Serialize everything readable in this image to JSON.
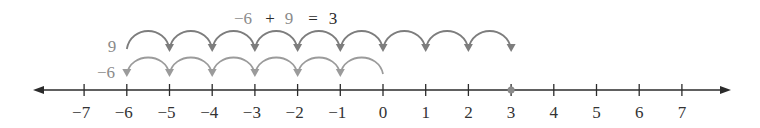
{
  "equation": {
    "term1": "−6",
    "plus": "+",
    "term2": "9",
    "equals": "=",
    "result": "3"
  },
  "rows": {
    "top": {
      "label": "9",
      "start": -6,
      "end": 3,
      "color": "#7d7d7d"
    },
    "bottom": {
      "label": "−6",
      "start": 0,
      "end": -6,
      "color": "#9b9b9b"
    }
  },
  "number_line": {
    "min": -7,
    "max": 7,
    "ticks": [
      "−7",
      "−6",
      "−5",
      "−4",
      "−3",
      "−2",
      "−1",
      "0",
      "1",
      "2",
      "3",
      "4",
      "5",
      "6",
      "7"
    ],
    "highlight_point": 3,
    "axis_color": "#2b2b2b",
    "point_color": "#8a8a8a"
  }
}
